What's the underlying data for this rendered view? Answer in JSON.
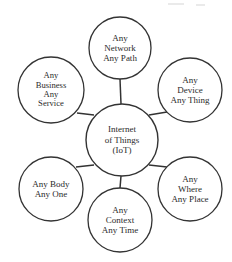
{
  "diagram": {
    "type": "hub-and-spoke",
    "background_color": "#ffffff",
    "stroke_color": "#333333",
    "text_color": "#2b2b2b",
    "center": {
      "id": "internet-of-things",
      "lines": [
        "Internet",
        "of Things",
        "(IoT)"
      ],
      "text": "Internet of Things (IoT)",
      "cx": 122,
      "cy": 140,
      "r": 36
    },
    "nodes": [
      {
        "id": "any-network-any-path",
        "lines": [
          "Any",
          "Network",
          "Any Path"
        ],
        "text": "Any Network Any Path",
        "cx": 120,
        "cy": 48,
        "r": 31,
        "position": "top"
      },
      {
        "id": "any-device-any-thing",
        "lines": [
          "Any",
          "Device",
          "Any Thing"
        ],
        "text": "Any Device Any Thing",
        "cx": 190,
        "cy": 90,
        "r": 32,
        "position": "upper-right"
      },
      {
        "id": "any-where-any-place",
        "lines": [
          "Any",
          "Where",
          "Any Place"
        ],
        "text": "Any Where Any Place",
        "cx": 190,
        "cy": 189,
        "r": 32,
        "position": "lower-right"
      },
      {
        "id": "any-context-any-time",
        "lines": [
          "Any",
          "Context",
          "Any Time"
        ],
        "text": "Any Context Any Time",
        "cx": 120,
        "cy": 220,
        "r": 32,
        "position": "bottom"
      },
      {
        "id": "any-body-any-one",
        "lines": [
          "Any Body",
          "Any One"
        ],
        "text": "Any Body Any One",
        "cx": 51,
        "cy": 189,
        "r": 32,
        "position": "lower-left"
      },
      {
        "id": "any-business-any-service",
        "lines": [
          "Any",
          "Business",
          "Any",
          "Service"
        ],
        "text": "Any Business Any Service",
        "cx": 51,
        "cy": 90,
        "r": 33,
        "position": "upper-left"
      }
    ],
    "connectors": [
      {
        "id": "connector-top",
        "from": "internet-of-things",
        "to": "any-network-any-path",
        "x1": 121,
        "y1": 104,
        "x2": 120,
        "y2": 79
      },
      {
        "id": "connector-upper-right",
        "from": "internet-of-things",
        "to": "any-device-any-thing",
        "x1": 149,
        "y1": 115,
        "x2": 167,
        "y2": 112
      },
      {
        "id": "connector-lower-right",
        "from": "internet-of-things",
        "to": "any-where-any-place",
        "x1": 149,
        "y1": 165,
        "x2": 167,
        "y2": 167
      },
      {
        "id": "connector-bottom",
        "from": "internet-of-things",
        "to": "any-context-any-time",
        "x1": 121,
        "y1": 176,
        "x2": 120,
        "y2": 188
      },
      {
        "id": "connector-lower-left",
        "from": "internet-of-things",
        "to": "any-body-any-one",
        "x1": 94,
        "y1": 165,
        "x2": 76,
        "y2": 167
      },
      {
        "id": "connector-upper-left",
        "from": "internet-of-things",
        "to": "any-business-any-service",
        "x1": 94,
        "y1": 115,
        "x2": 77,
        "y2": 113
      }
    ]
  }
}
